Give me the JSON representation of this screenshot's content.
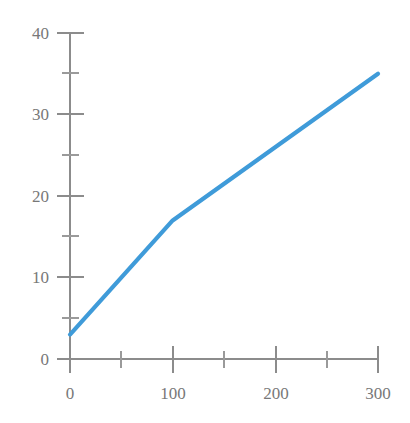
{
  "chart_data": {
    "type": "line",
    "title": "",
    "subtitle": "",
    "xlabel": "",
    "ylabel": "",
    "xlim": [
      0,
      300
    ],
    "ylim": [
      0,
      40
    ],
    "grid": false,
    "legend": false,
    "legend_position": "none",
    "x_major_ticks": [
      0,
      100,
      200,
      300
    ],
    "x_minor_ticks": [
      50,
      150,
      250
    ],
    "y_major_ticks": [
      0,
      10,
      20,
      30,
      40
    ],
    "y_minor_ticks": [
      5,
      15,
      25,
      35
    ],
    "x_tick_labels": [
      "0",
      "100",
      "200",
      "300"
    ],
    "y_tick_labels": [
      "0",
      "10",
      "20",
      "30",
      "40"
    ],
    "series": [
      {
        "name": "series-1",
        "color": "#3f9bd9",
        "x": [
          0,
          100,
          300
        ],
        "values": [
          3,
          17,
          35
        ]
      }
    ],
    "annotations": []
  },
  "style": {
    "background": "#ffffff",
    "axis_color": "#8c8c8c",
    "label_color": "#787878",
    "line_color": "#3f9bd9"
  },
  "axis": {
    "y_axis_name": "y-axis",
    "x_axis_name": "x-axis"
  }
}
